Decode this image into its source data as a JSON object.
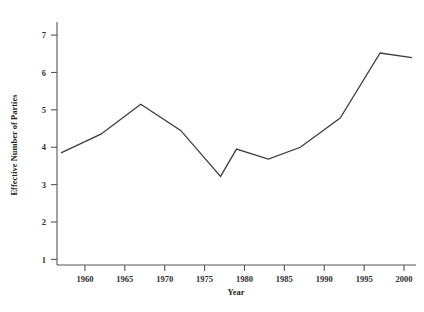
{
  "chart_data": {
    "type": "line",
    "title": "",
    "xlabel": "Year",
    "ylabel": "Effective Number of Parties",
    "xlim": [
      1956.5,
      2001.5
    ],
    "ylim": [
      0.85,
      7.35
    ],
    "grid": false,
    "legend": null,
    "xticks": [
      1960,
      1965,
      1970,
      1975,
      1980,
      1985,
      1990,
      1995,
      2000
    ],
    "xtick_labels": [
      "1960",
      "1965",
      "1970",
      "1975",
      "1980",
      "1985",
      "1990",
      "1995",
      "2000"
    ],
    "yticks": [
      1,
      2,
      3,
      4,
      5,
      6,
      7
    ],
    "ytick_labels": [
      "1",
      "2",
      "3",
      "4",
      "5",
      "6",
      "7"
    ],
    "series": [
      {
        "name": "Effective Number of Parties",
        "color": "#3a3a40",
        "x": [
          1957,
          1962,
          1967,
          1972,
          1977,
          1979,
          1983,
          1987,
          1992,
          1997,
          2001
        ],
        "values": [
          3.85,
          4.35,
          5.15,
          4.45,
          3.22,
          3.95,
          3.68,
          4.0,
          4.78,
          6.52,
          6.4
        ]
      }
    ]
  },
  "axes": {
    "y_axis_title": "Effective Number of Parties",
    "x_axis_title": "Year"
  }
}
